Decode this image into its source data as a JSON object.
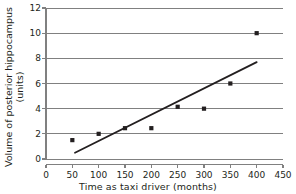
{
  "chart_data": {
    "type": "scatter",
    "title": "",
    "xlabel": "Time as taxi driver (months)",
    "ylabel_line1": "Volume of posterior hippocampus",
    "ylabel_line2": "(units)",
    "ylabel": "Volume of posterior hippocampus (units)",
    "xlim": [
      0,
      450
    ],
    "ylim": [
      0,
      12
    ],
    "xticks": [
      "0",
      "50",
      "100",
      "150",
      "200",
      "250",
      "300",
      "350",
      "400",
      "450"
    ],
    "xtick_values": [
      0,
      50,
      100,
      150,
      200,
      250,
      300,
      350,
      400,
      450
    ],
    "yticks": [
      "0",
      "2",
      "4",
      "6",
      "8",
      "10",
      "12"
    ],
    "ytick_values": [
      0,
      2,
      4,
      6,
      8,
      10,
      12
    ],
    "grid": "horizontal",
    "legend": "none",
    "x": [
      50,
      100,
      150,
      200,
      250,
      300,
      350,
      400
    ],
    "values": [
      1.5,
      2.0,
      2.45,
      2.45,
      4.15,
      4.0,
      6.0,
      10.0
    ],
    "points": [
      {
        "x": 50,
        "y": 1.5
      },
      {
        "x": 100,
        "y": 2.0
      },
      {
        "x": 150,
        "y": 2.45
      },
      {
        "x": 200,
        "y": 2.45
      },
      {
        "x": 250,
        "y": 4.15
      },
      {
        "x": 300,
        "y": 4.0
      },
      {
        "x": 350,
        "y": 6.0
      },
      {
        "x": 400,
        "y": 10.0
      }
    ],
    "trendline": {
      "x0": 55,
      "y0": 0.5,
      "x1": 400,
      "y1": 7.7
    },
    "marker": "square",
    "marker_color": "#231f20",
    "line_color": "#231f20",
    "grid_color": "#808080",
    "axis_color": "#808080",
    "background_color": "#ffffff"
  }
}
